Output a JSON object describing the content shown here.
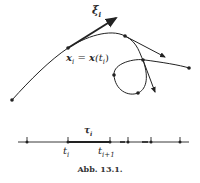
{
  "figure": {
    "labels": {
      "tangent": "ξ",
      "tangent_sub": "i",
      "point_eq_lhs": "x",
      "point_eq_sub": "i",
      "point_eq_mid": " = ",
      "point_eq_rhs": "x",
      "point_eq_arg": "(t",
      "point_eq_arg_sub": "i",
      "point_eq_close": ")",
      "tau": "τ",
      "tau_sub": "i",
      "t_i": "t",
      "t_i_sub": "i",
      "t_i1": "t",
      "t_i1_sub": "i+1"
    },
    "caption": "Abb. 13.1."
  }
}
